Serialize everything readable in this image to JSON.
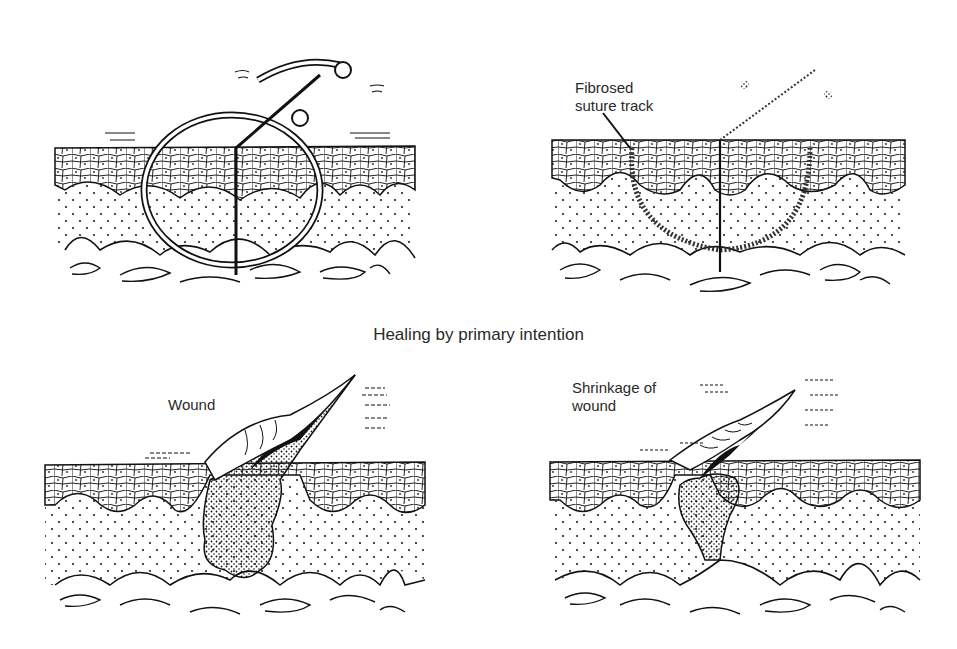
{
  "figure": {
    "caption": "Healing by primary intention",
    "panels": [
      {
        "id": "sutured-wound",
        "position": "top-left",
        "label": ""
      },
      {
        "id": "healed-suture-track",
        "position": "top-right",
        "label": "Fibrosed\nsuture track"
      },
      {
        "id": "open-wound",
        "position": "bottom-left",
        "label": "Wound"
      },
      {
        "id": "shrinking-wound",
        "position": "bottom-right",
        "label": "Shrinkage of\nwound"
      }
    ],
    "layers": [
      "epidermis",
      "dermis",
      "subcutaneous fat"
    ],
    "colors": {
      "ink": "#111111",
      "paper": "#ffffff"
    }
  }
}
